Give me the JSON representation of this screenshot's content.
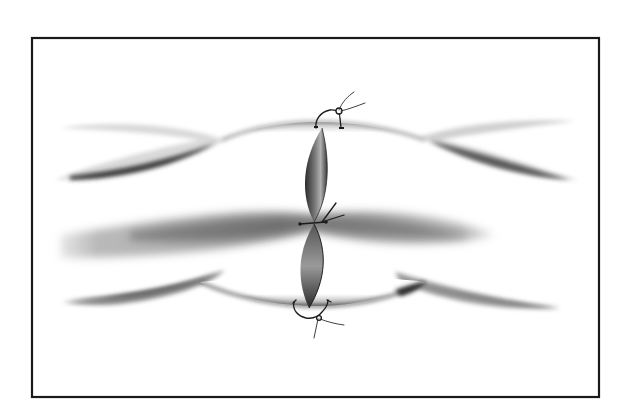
{
  "figure": {
    "type": "medical-illustration",
    "frame": {
      "x": 32,
      "y": 38,
      "width": 567,
      "height": 359,
      "stroke": "#1a1a1a"
    },
    "colors": {
      "background": "#ffffff",
      "shade_dark": "#3a3a3a",
      "shade_mid": "#8a8a8a",
      "shade_light": "#d8d8d8",
      "suture": "#1c1c1c"
    },
    "strands": [
      {
        "name": "upper-strand",
        "position": "top"
      },
      {
        "name": "middle-strand",
        "position": "middle"
      },
      {
        "name": "lower-strand",
        "position": "bottom"
      }
    ],
    "cut": {
      "x": 312,
      "upper_lobe": [
        124,
        222
      ],
      "lower_lobe": [
        222,
        305
      ]
    },
    "sutures": [
      {
        "name": "top-suture",
        "knot": [
          339,
          111
        ],
        "position": "top"
      },
      {
        "name": "middle-suture",
        "knot": [
          312,
          224
        ],
        "position": "middle"
      },
      {
        "name": "bottom-suture",
        "knot": [
          319,
          318
        ],
        "position": "bottom"
      }
    ]
  }
}
